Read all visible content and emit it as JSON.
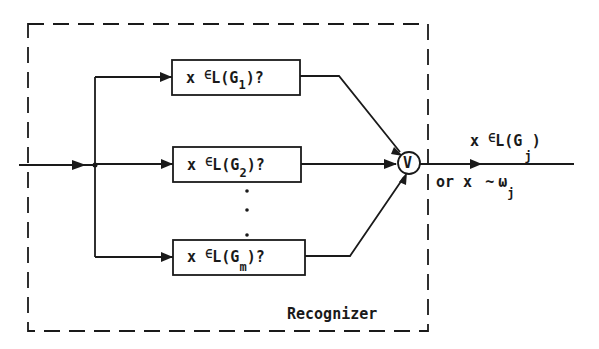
{
  "diagram": {
    "type": "block-diagram",
    "container": {
      "label": "Recognizer",
      "style": "dashed"
    },
    "input": {
      "label": ""
    },
    "tests": [
      {
        "id": "G1",
        "prefix": "x ",
        "member": "∈",
        "lang": "L(G",
        "sub": "1",
        "suffix": ")?"
      },
      {
        "id": "G2",
        "prefix": "x ",
        "member": "∈",
        "lang": "L(G",
        "sub": "2",
        "suffix": ")?"
      },
      {
        "id": "Gm",
        "prefix": "x ",
        "member": "∈",
        "lang": "L(G",
        "sub": "m",
        "suffix": ")?"
      }
    ],
    "ellipsis": ".",
    "combiner": {
      "symbol": "V",
      "meaning": "logical OR"
    },
    "output": {
      "line1": {
        "prefix": "x ",
        "member": "∈",
        "lang": "L(G",
        "sub": "j",
        "suffix": ")"
      },
      "line2": {
        "prefix": "or x ",
        "relation": "~",
        "class": "ω",
        "sub": "j"
      }
    },
    "colors": {
      "ink": "#1a1a1a",
      "background": "#ffffff"
    }
  }
}
